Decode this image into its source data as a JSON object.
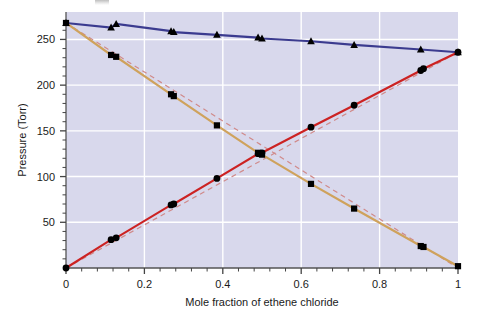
{
  "chart_data": {
    "type": "scatter",
    "title": "",
    "xlabel": "Mole fraction of ethene chloride",
    "ylabel": "Pressure (Torr)",
    "xlim": [
      0,
      1
    ],
    "ylim": [
      0,
      280
    ],
    "xticks": [
      0,
      0.2,
      0.4,
      0.6,
      0.8,
      1
    ],
    "xticklabels": [
      "0",
      "0.2",
      "0.4",
      "0.6",
      "0.8",
      "1"
    ],
    "xminorticks": [
      0.04,
      0.08,
      0.12,
      0.16,
      0.24,
      0.28,
      0.32,
      0.36,
      0.44,
      0.48,
      0.52,
      0.56,
      0.64,
      0.68,
      0.72,
      0.76,
      0.84,
      0.88,
      0.92,
      0.96
    ],
    "yticks": [
      50,
      100,
      150,
      200,
      250
    ],
    "yticklabels": [
      "50",
      "100",
      "150",
      "200",
      "250"
    ],
    "yminorticks": [
      10,
      20,
      30,
      40,
      60,
      70,
      80,
      90,
      110,
      120,
      130,
      140,
      160,
      170,
      180,
      190,
      210,
      220,
      230,
      240,
      260
    ],
    "grid": true,
    "gridcolor": "#ffffff",
    "plotbg": "#d8d8ec",
    "legend_position": "none",
    "series": [
      {
        "name": "total-pressure",
        "marker": "triangle",
        "color": "#3b3b8f",
        "linestyle": "solid",
        "points": [
          {
            "x": 0.0,
            "y": 268
          },
          {
            "x": 0.115,
            "y": 263
          },
          {
            "x": 0.128,
            "y": 267
          },
          {
            "x": 0.268,
            "y": 259
          },
          {
            "x": 0.275,
            "y": 258
          },
          {
            "x": 0.385,
            "y": 255
          },
          {
            "x": 0.49,
            "y": 252
          },
          {
            "x": 0.5,
            "y": 251
          },
          {
            "x": 0.625,
            "y": 248
          },
          {
            "x": 0.735,
            "y": 244
          },
          {
            "x": 0.905,
            "y": 239
          },
          {
            "x": 1.0,
            "y": 236
          }
        ]
      },
      {
        "name": "ethene-chloride-partial-pressure",
        "marker": "circle",
        "color": "#cc2222",
        "linestyle": "solid",
        "points": [
          {
            "x": 0.0,
            "y": 0
          },
          {
            "x": 0.115,
            "y": 31
          },
          {
            "x": 0.128,
            "y": 33
          },
          {
            "x": 0.268,
            "y": 69
          },
          {
            "x": 0.275,
            "y": 70
          },
          {
            "x": 0.385,
            "y": 98
          },
          {
            "x": 0.49,
            "y": 125
          },
          {
            "x": 0.5,
            "y": 126
          },
          {
            "x": 0.625,
            "y": 154
          },
          {
            "x": 0.735,
            "y": 178
          },
          {
            "x": 0.905,
            "y": 216
          },
          {
            "x": 0.912,
            "y": 218
          },
          {
            "x": 1.0,
            "y": 236
          }
        ]
      },
      {
        "name": "benzene-partial-pressure",
        "marker": "square",
        "color": "#cfa25c",
        "linestyle": "solid",
        "points": [
          {
            "x": 0.0,
            "y": 268
          },
          {
            "x": 0.115,
            "y": 233
          },
          {
            "x": 0.128,
            "y": 231
          },
          {
            "x": 0.268,
            "y": 190
          },
          {
            "x": 0.275,
            "y": 188
          },
          {
            "x": 0.385,
            "y": 156
          },
          {
            "x": 0.49,
            "y": 126
          },
          {
            "x": 0.5,
            "y": 124
          },
          {
            "x": 0.625,
            "y": 92
          },
          {
            "x": 0.735,
            "y": 65
          },
          {
            "x": 0.905,
            "y": 24
          },
          {
            "x": 0.912,
            "y": 23
          },
          {
            "x": 1.0,
            "y": 2
          }
        ]
      },
      {
        "name": "raoults-law-ideal-ethene-chloride",
        "marker": "none",
        "color": "#d08a8a",
        "linestyle": "dashed",
        "points": [
          {
            "x": 0.0,
            "y": 0
          },
          {
            "x": 1.0,
            "y": 236
          }
        ]
      },
      {
        "name": "raoults-law-ideal-benzene",
        "marker": "none",
        "color": "#d08a8a",
        "linestyle": "dashed",
        "points": [
          {
            "x": 0.0,
            "y": 268
          },
          {
            "x": 1.0,
            "y": 0
          }
        ]
      }
    ]
  }
}
